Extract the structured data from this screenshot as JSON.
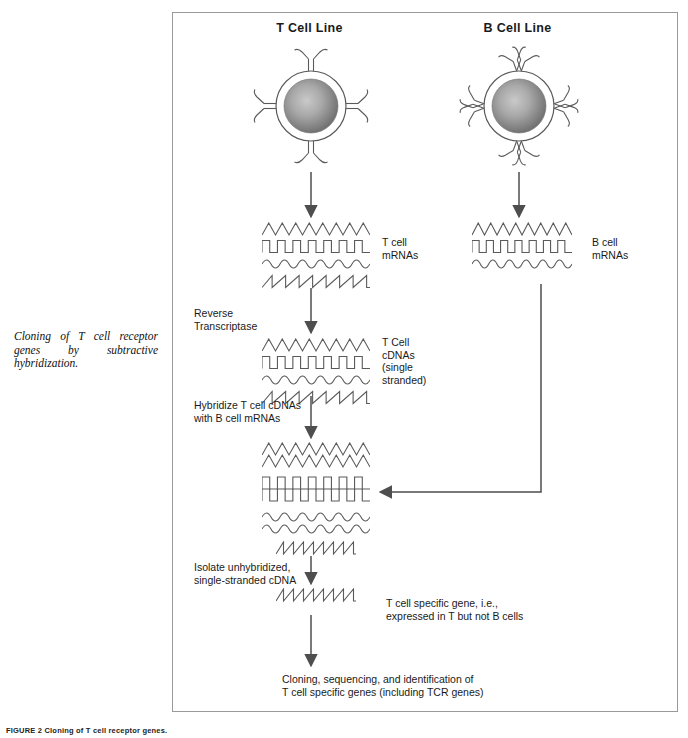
{
  "figure": {
    "side_caption": "Cloning of T cell receptor genes by subtractive hybridization.",
    "figure_number": "FIGURE 2  Cloning of T cell receptor genes.",
    "line_color": "#5a5a5a",
    "border_color": "#9a9a9a",
    "nucleus_center_color": "#bdbdbd",
    "nucleus_edge_color": "#737373"
  },
  "cells": {
    "t_cell": {
      "title": "T Cell Line",
      "receptor_type": "t-cell-receptor",
      "receptor_count": 4
    },
    "b_cell": {
      "title": "B Cell Line",
      "receptor_type": "antibody-receptor",
      "receptor_count": 4
    }
  },
  "labels": {
    "t_mrna": "T cell\nmRNAs",
    "b_mrna": "B cell\nmRNAs",
    "reverse_transcriptase": "Reverse\nTranscriptase",
    "t_cdna": "T Cell\ncDNAs\n(single\nstranded)",
    "hybridize": "Hybridize T cell cDNAs\nwith B cell mRNAs",
    "isolate": "Isolate unhybridized,\nsingle-stranded cDNA",
    "specific_gene": "T cell specific gene, i.e.,\nexpressed in T but not B cells",
    "final_step": "Cloning, sequencing, and identification of\nT cell specific genes (including TCR genes)"
  },
  "strands": {
    "t_mrna": [
      "zigzag",
      "square",
      "sine",
      "sawtooth"
    ],
    "b_mrna": [
      "zigzag",
      "square",
      "sine"
    ],
    "t_cdna": [
      "zigzag",
      "square",
      "sine",
      "sawtooth"
    ],
    "hybridized": [
      "zigzag",
      "zigzag",
      "square",
      "square",
      "sine",
      "sine"
    ],
    "unhybridized": [
      "sawtooth"
    ],
    "specific_gene": [
      "sawtooth"
    ]
  },
  "flow": {
    "t_cell_to_mrna": "arrow-down",
    "b_cell_to_mrna": "arrow-down",
    "mrna_to_cdna": "arrow-down",
    "cdna_to_hybrid": "arrow-down",
    "b_mrna_to_hybrid": "arrow-left-elbow",
    "hybrid_to_isolate": "arrow-down",
    "isolate_to_gene": "arrow-down",
    "gene_to_cloning": "arrow-down"
  }
}
